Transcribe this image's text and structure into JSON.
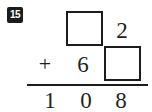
{
  "problem": {
    "number_label": "15",
    "operator": "+",
    "operator_name": "plus-sign",
    "top_addend": {
      "tens": "",
      "tens_is_blank": true,
      "ones": "2"
    },
    "bottom_addend": {
      "tens": "6",
      "ones": "",
      "ones_is_blank": true
    },
    "sum_digits": [
      "1",
      "0",
      "8"
    ],
    "blank_box_count": 2,
    "colors": {
      "ink": "#1c1c1c",
      "badge_background": "#1c1c1c",
      "badge_text": "#ffffff",
      "page_background": "#ffffff"
    }
  }
}
